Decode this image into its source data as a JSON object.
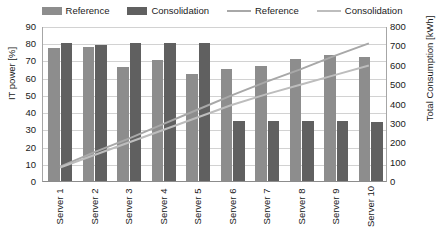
{
  "chart_data": {
    "type": "bar",
    "title": "",
    "subtitle": "",
    "categories": [
      "Server 1",
      "Server 2",
      "Server 3",
      "Server 4",
      "Server 5",
      "Server 6",
      "Server 7",
      "Server 8",
      "Server 9",
      "Server 10"
    ],
    "xlabel": "",
    "ylabel": "IT power [%]",
    "y2label": "Total Consumption [kWh]",
    "ylim": [
      0,
      90
    ],
    "y2lim": [
      0,
      800
    ],
    "y_ticks": [
      0,
      10,
      20,
      30,
      40,
      50,
      60,
      70,
      80,
      90
    ],
    "y2_ticks": [
      0,
      100,
      200,
      300,
      400,
      500,
      600,
      700,
      800
    ],
    "grid": true,
    "legend_position": "top",
    "series": [
      {
        "name": "Reference",
        "kind": "bar",
        "axis": "left",
        "color": "#8d8d8d",
        "values": [
          77,
          78,
          66,
          70,
          62,
          65,
          67,
          71,
          73,
          72
        ]
      },
      {
        "name": "Consolidation",
        "kind": "bar",
        "axis": "left",
        "color": "#606060",
        "values": [
          80,
          79,
          80,
          80,
          80,
          35,
          35,
          35,
          35,
          34
        ]
      },
      {
        "name": "Reference",
        "kind": "line",
        "axis": "right",
        "color": "#a8a8a8",
        "values": [
          75,
          150,
          220,
          295,
          370,
          445,
          515,
          580,
          650,
          715
        ]
      },
      {
        "name": "Consolidation",
        "kind": "line",
        "axis": "right",
        "color": "#bdbdbd",
        "values": [
          70,
          135,
          200,
          265,
          330,
          395,
          450,
          500,
          550,
          600
        ]
      }
    ]
  },
  "legend": {
    "entries": [
      {
        "label": "Reference",
        "type": "bar",
        "color": "#8d8d8d"
      },
      {
        "label": "Consolidation",
        "type": "bar",
        "color": "#606060"
      },
      {
        "label": "Reference",
        "type": "line",
        "color": "#a8a8a8"
      },
      {
        "label": "Consolidation",
        "type": "line",
        "color": "#bdbdbd"
      }
    ]
  }
}
